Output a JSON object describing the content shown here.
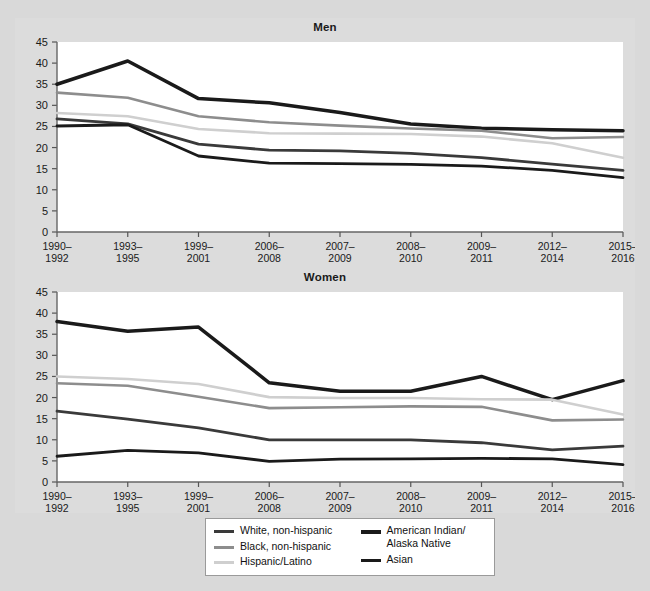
{
  "panels": [
    {
      "title": "Men"
    },
    {
      "title": "Women"
    }
  ],
  "legend": {
    "items": [
      {
        "label": "White, non-hispanic",
        "color": "#3a3a3a",
        "width": 3
      },
      {
        "label": "Black, non-hispanic",
        "color": "#8d8d8d",
        "width": 3
      },
      {
        "label": "Hispanic/Latino",
        "color": "#cfcfcf",
        "width": 3
      },
      {
        "label": "American Indian/\nAlaska Native",
        "color": "#1a1a1a",
        "width": 3.5
      },
      {
        "label": "Asian",
        "color": "#1a1a1a",
        "width": 3
      }
    ]
  },
  "chart_data": [
    {
      "type": "line",
      "title": "Men",
      "xlabel": "",
      "ylabel": "",
      "ylim": [
        0,
        45
      ],
      "yticks": [
        0,
        5,
        10,
        15,
        20,
        25,
        30,
        35,
        40,
        45
      ],
      "grid": false,
      "legend_position": "bottom",
      "categories": [
        "1990–\n1992",
        "1993–\n1995",
        "1999–\n2001",
        "2006–\n2008",
        "2007–\n2009",
        "2008–\n2010",
        "2009–\n2011",
        "2012–\n2014",
        "2015–\n2016"
      ],
      "series": [
        {
          "name": "American Indian/Alaska Native",
          "color": "#1a1a1a",
          "width": 3.5,
          "values": [
            35.0,
            40.5,
            31.6,
            30.6,
            28.3,
            25.6,
            24.6,
            24.2,
            24.0
          ]
        },
        {
          "name": "Black, non-hispanic",
          "color": "#8d8d8d",
          "width": 2.6,
          "values": [
            33.0,
            31.8,
            27.4,
            26.0,
            25.2,
            24.5,
            24.0,
            22.2,
            22.5
          ]
        },
        {
          "name": "Hispanic/Latino",
          "color": "#cfcfcf",
          "width": 2.6,
          "values": [
            28.2,
            27.4,
            24.4,
            23.4,
            23.3,
            23.2,
            22.6,
            21.0,
            17.6
          ]
        },
        {
          "name": "White, non-hispanic",
          "color": "#3a3a3a",
          "width": 2.8,
          "values": [
            26.8,
            25.6,
            20.8,
            19.4,
            19.2,
            18.6,
            17.6,
            16.1,
            14.6
          ]
        },
        {
          "name": "Asian",
          "color": "#1a1a1a",
          "width": 2.8,
          "values": [
            25.1,
            25.4,
            18.0,
            16.3,
            16.2,
            16.0,
            15.6,
            14.6,
            12.9
          ]
        }
      ]
    },
    {
      "type": "line",
      "title": "Women",
      "xlabel": "",
      "ylabel": "",
      "ylim": [
        0,
        45
      ],
      "yticks": [
        0,
        5,
        10,
        15,
        20,
        25,
        30,
        35,
        40,
        45
      ],
      "grid": false,
      "legend_position": "bottom",
      "categories": [
        "1990–\n1992",
        "1993–\n1995",
        "1999–\n2001",
        "2006–\n2008",
        "2007–\n2009",
        "2008–\n2010",
        "2009–\n2011",
        "2012–\n2014",
        "2015–\n2016"
      ],
      "series": [
        {
          "name": "American Indian/Alaska Native",
          "color": "#1a1a1a",
          "width": 3.5,
          "values": [
            38.0,
            35.7,
            36.7,
            23.5,
            21.5,
            21.5,
            25.0,
            19.5,
            24.0
          ]
        },
        {
          "name": "Hispanic/Latino",
          "color": "#cfcfcf",
          "width": 2.6,
          "values": [
            25.0,
            24.4,
            23.2,
            20.1,
            19.9,
            19.9,
            19.6,
            19.5,
            16.0
          ]
        },
        {
          "name": "Black, non-hispanic",
          "color": "#8d8d8d",
          "width": 2.6,
          "values": [
            23.4,
            22.8,
            20.2,
            17.5,
            17.7,
            17.9,
            17.8,
            14.6,
            14.8
          ]
        },
        {
          "name": "White, non-hispanic",
          "color": "#3a3a3a",
          "width": 2.8,
          "values": [
            16.8,
            14.9,
            12.8,
            10.0,
            10.0,
            10.0,
            9.3,
            7.6,
            8.5
          ]
        },
        {
          "name": "Asian",
          "color": "#1a1a1a",
          "width": 2.8,
          "values": [
            6.1,
            7.5,
            6.9,
            4.9,
            5.4,
            5.5,
            5.6,
            5.5,
            4.1
          ]
        }
      ]
    }
  ]
}
